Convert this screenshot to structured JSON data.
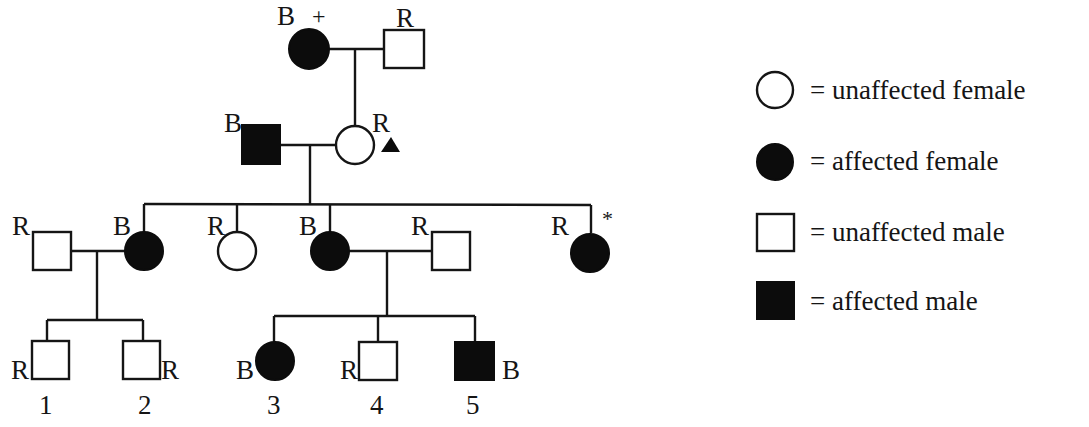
{
  "diagram": {
    "type": "pedigree",
    "colors": {
      "ink": "#151515",
      "fill_affected": "#0c0c0c",
      "background": "#ffffff"
    },
    "generations": [
      {
        "id": "I",
        "individuals": [
          {
            "id": "I-1",
            "sex": "female",
            "affected": true,
            "label": "B",
            "mark": "+"
          },
          {
            "id": "I-2",
            "sex": "male",
            "affected": false,
            "label": "R"
          }
        ]
      },
      {
        "id": "II",
        "individuals": [
          {
            "id": "II-1",
            "sex": "male",
            "affected": true,
            "label": "B"
          },
          {
            "id": "II-2",
            "sex": "female",
            "affected": false,
            "label": "R",
            "mark": "▲"
          }
        ]
      },
      {
        "id": "III",
        "individuals": [
          {
            "id": "III-spouse-1",
            "sex": "male",
            "affected": false,
            "label": "R"
          },
          {
            "id": "III-1",
            "sex": "female",
            "affected": true,
            "label": "B"
          },
          {
            "id": "III-2",
            "sex": "female",
            "affected": false,
            "label": "R"
          },
          {
            "id": "III-3",
            "sex": "female",
            "affected": true,
            "label": "B"
          },
          {
            "id": "III-spouse-2",
            "sex": "male",
            "affected": false,
            "label": "R"
          },
          {
            "id": "III-4",
            "sex": "female",
            "affected": true,
            "label": "R",
            "mark": "*"
          }
        ]
      },
      {
        "id": "IV",
        "individuals": [
          {
            "id": "IV-1",
            "sex": "male",
            "affected": false,
            "label": "R",
            "number": "1"
          },
          {
            "id": "IV-2",
            "sex": "male",
            "affected": false,
            "label": "R",
            "number": "2"
          },
          {
            "id": "IV-3",
            "sex": "female",
            "affected": true,
            "label": "B",
            "number": "3"
          },
          {
            "id": "IV-4",
            "sex": "male",
            "affected": false,
            "label": "R",
            "number": "4"
          },
          {
            "id": "IV-5",
            "sex": "male",
            "affected": true,
            "label": "B",
            "number": "5"
          }
        ]
      }
    ]
  },
  "labels": {
    "g1_female": "B",
    "g1_plus": "+",
    "g1_male": "R",
    "g2_male": "B",
    "g2_female": "R",
    "g2_triangle": "▲",
    "g3_spouse1": "R",
    "g3_d1": "B",
    "g3_d2": "R",
    "g3_d3": "B",
    "g3_spouse2": "R",
    "g3_d4": "R",
    "g3_star": "*",
    "g4_c1": "R",
    "g4_c2": "R",
    "g4_c3": "B",
    "g4_c4": "R",
    "g4_c5": "B",
    "n1": "1",
    "n2": "2",
    "n3": "3",
    "n4": "4",
    "n5": "5"
  },
  "legend": {
    "items": [
      {
        "symbol": "open-circle",
        "text": "= unaffected female"
      },
      {
        "symbol": "filled-circle",
        "text": "= affected female"
      },
      {
        "symbol": "open-square",
        "text": "= unaffected male"
      },
      {
        "symbol": "filled-square",
        "text": "= affected male"
      }
    ]
  }
}
